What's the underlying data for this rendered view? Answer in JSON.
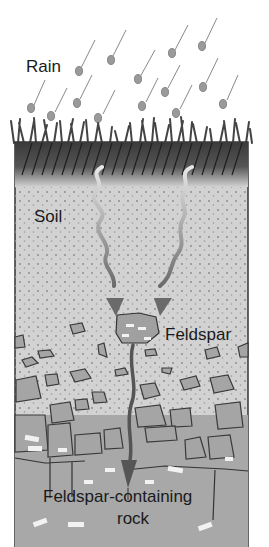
{
  "labels": {
    "rain": "Rain",
    "soil": "Soil",
    "feldspar": "Feldspar",
    "rock_line1": "Feldspar-containing",
    "rock_line2": "rock"
  },
  "colors": {
    "background": "#ffffff",
    "topsoil": "#3a3a3a",
    "soil": "#d2d2d2",
    "rock": "#a8a8a8",
    "arrow": "#6e6e6e",
    "drop": "#9a9a9a",
    "crystal": "#f2f2f2"
  }
}
